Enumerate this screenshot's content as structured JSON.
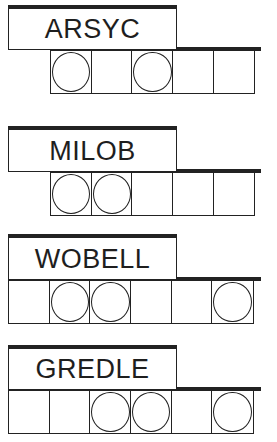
{
  "puzzle": {
    "type": "jumble",
    "clues": [
      {
        "scrambled": "ARSYC",
        "cells": 5,
        "circled": [
          0,
          2
        ],
        "answer": ""
      },
      {
        "scrambled": "MILOB",
        "cells": 5,
        "circled": [
          0,
          1
        ],
        "answer": ""
      },
      {
        "scrambled": "WOBELL",
        "cells": 6,
        "circled": [
          1,
          2,
          5
        ],
        "answer": ""
      },
      {
        "scrambled": "GREDLE",
        "cells": 6,
        "circled": [
          2,
          3,
          5
        ],
        "answer": ""
      }
    ]
  },
  "colors": {
    "ink": "#222222",
    "background": "#ffffff"
  }
}
